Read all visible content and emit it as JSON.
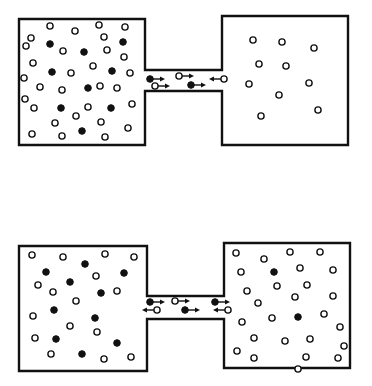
{
  "figure": {
    "colors": {
      "ink": "#111111",
      "background": "#ffffff"
    },
    "legend": {
      "open_circle": "particle type A (open circle)",
      "filled_circle": "particle type B (filled circle)"
    },
    "panels": [
      {
        "id": "top",
        "label": "initial state",
        "left_chamber": {
          "open": [
            [
              31,
              38
            ],
            [
              50,
              26
            ],
            [
              75,
              31
            ],
            [
              99,
              25
            ],
            [
              104,
              37
            ],
            [
              125,
              27
            ],
            [
              26,
              46
            ],
            [
              63,
              51
            ],
            [
              107,
              50
            ],
            [
              124,
              57
            ],
            [
              33,
              63
            ],
            [
              71,
              73
            ],
            [
              93,
              66
            ],
            [
              24,
              78
            ],
            [
              40,
              87
            ],
            [
              62,
              90
            ],
            [
              100,
              86
            ],
            [
              117,
              88
            ],
            [
              130,
              73
            ],
            [
              25,
              99
            ],
            [
              34,
              108
            ],
            [
              88,
              107
            ],
            [
              132,
              104
            ],
            [
              55,
              123
            ],
            [
              76,
              116
            ],
            [
              101,
              122
            ],
            [
              32,
              134
            ],
            [
              62,
              136
            ],
            [
              105,
              137
            ],
            [
              128,
              128
            ]
          ],
          "filled": [
            [
              50,
              44
            ],
            [
              84,
              52
            ],
            [
              123,
              42
            ],
            [
              52,
              72
            ],
            [
              112,
              71
            ],
            [
              88,
              88
            ],
            [
              61,
              108
            ],
            [
              111,
              108
            ],
            [
              82,
              131
            ]
          ]
        },
        "right_chamber": {
          "open": [
            [
              253,
              40
            ],
            [
              282,
              42
            ],
            [
              314,
              48
            ],
            [
              259,
              64
            ],
            [
              286,
              66
            ],
            [
              249,
              84
            ],
            [
              309,
              83
            ],
            [
              279,
              95
            ],
            [
              318,
              110
            ],
            [
              261,
              116
            ]
          ],
          "filled": []
        },
        "channel": [
          {
            "type": "filled",
            "x": 150,
            "y": 79,
            "dir": "right"
          },
          {
            "type": "open",
            "x": 179,
            "y": 76,
            "dir": "right"
          },
          {
            "type": "open",
            "x": 224,
            "y": 79,
            "dir": "left"
          },
          {
            "type": "open",
            "x": 155,
            "y": 86,
            "dir": "right"
          },
          {
            "type": "filled",
            "x": 191,
            "y": 85,
            "dir": "right"
          }
        ]
      },
      {
        "id": "bottom",
        "label": "later state",
        "left_chamber": {
          "open": [
            [
              32,
              255
            ],
            [
              63,
              257
            ],
            [
              105,
              254
            ],
            [
              134,
              257
            ],
            [
              38,
              285
            ],
            [
              53,
              292
            ],
            [
              96,
              276
            ],
            [
              76,
              301
            ],
            [
              117,
              291
            ],
            [
              33,
              316
            ],
            [
              70,
              326
            ],
            [
              97,
              332
            ],
            [
              35,
              338
            ],
            [
              51,
              354
            ],
            [
              104,
              359
            ],
            [
              131,
              357
            ]
          ],
          "filled": [
            [
              46,
              272
            ],
            [
              85,
              264
            ],
            [
              124,
              273
            ],
            [
              70,
              282
            ],
            [
              101,
              293
            ],
            [
              54,
              310
            ],
            [
              95,
              318
            ],
            [
              56,
              339
            ],
            [
              117,
              343
            ],
            [
              82,
              354
            ]
          ]
        },
        "right_chamber": {
          "open": [
            [
              236,
              253
            ],
            [
              264,
              259
            ],
            [
              290,
              252
            ],
            [
              320,
              252
            ],
            [
              241,
              272
            ],
            [
              300,
              268
            ],
            [
              333,
              270
            ],
            [
              247,
              291
            ],
            [
              277,
              286
            ],
            [
              307,
              285
            ],
            [
              333,
              296
            ],
            [
              258,
              303
            ],
            [
              295,
              297
            ],
            [
              242,
              322
            ],
            [
              272,
              318
            ],
            [
              324,
              314
            ],
            [
              340,
              327
            ],
            [
              254,
              338
            ],
            [
              285,
              341
            ],
            [
              310,
              339
            ],
            [
              344,
              346
            ],
            [
              237,
              351
            ],
            [
              254,
              358
            ],
            [
              306,
              357
            ],
            [
              338,
              358
            ],
            [
              298,
              369
            ]
          ],
          "filled": [
            [
              274,
              272
            ],
            [
              298,
              317
            ]
          ]
        },
        "channel": [
          {
            "type": "filled",
            "x": 150,
            "y": 302,
            "dir": "right"
          },
          {
            "type": "open",
            "x": 175,
            "y": 301,
            "dir": "right"
          },
          {
            "type": "filled",
            "x": 215,
            "y": 302,
            "dir": "right"
          },
          {
            "type": "open",
            "x": 157,
            "y": 310,
            "dir": "left"
          },
          {
            "type": "filled",
            "x": 185,
            "y": 310,
            "dir": "right"
          },
          {
            "type": "open",
            "x": 228,
            "y": 310,
            "dir": "left"
          }
        ]
      }
    ]
  }
}
